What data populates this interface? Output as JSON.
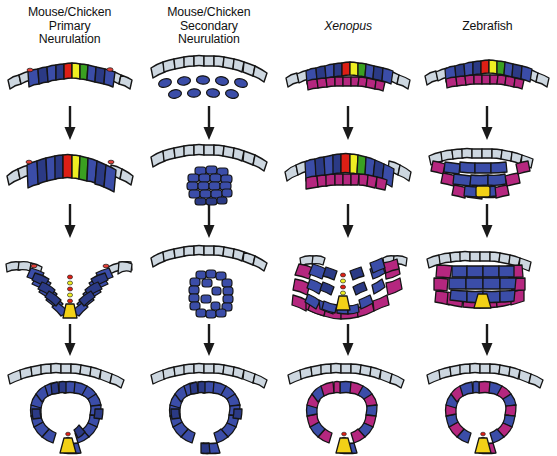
{
  "figure": {
    "background_color": "#ffffff",
    "arrow_color": "#1a1a1a"
  },
  "palette": {
    "epidermis": "#cdd7e0",
    "epidermis_dark": "#6e7b86",
    "neural_blue": "#3b4da8",
    "neural_blue_dark": "#2b3a85",
    "neural_blue_light": "#5566c0",
    "mesoderm_magenta": "#b5277f",
    "mesoderm_magenta_dark": "#96205f",
    "floorplate_yellow": "#f2d117",
    "marker_red": "#dd1f15",
    "marker_yellow": "#eeee22",
    "marker_green": "#3aa021",
    "neural_crest_red": "#e04038",
    "outline": "#151515"
  },
  "columns": [
    {
      "id": "mouse-chicken-primary",
      "header_lines": [
        "Mouse/Chicken",
        "Primary",
        "Neurulation"
      ],
      "italic": false,
      "stages": [
        {
          "name": "neural-plate",
          "description": "Flat neural plate with blue neuroepithelial cells and red, yellow, green midline marker cells flanked by epidermis",
          "has_magenta_layer": false
        },
        {
          "name": "neural-plate-shaping",
          "description": "Thickened neural plate, columnar cells, median hinge point forming",
          "has_magenta_layer": false
        },
        {
          "name": "neural-groove",
          "description": "V-shaped neural groove with elevated neural folds, yellow floor plate and red neural crest at fold tips",
          "has_magenta_layer": false
        },
        {
          "name": "neural-tube",
          "description": "Closed neural tube beneath continuous epidermis, yellow floor plate at ventral midline",
          "has_magenta_layer": false
        }
      ]
    },
    {
      "id": "mouse-chicken-secondary",
      "header_lines": [
        "Mouse/Chicken",
        "Secondary",
        "Neurulation"
      ],
      "italic": false,
      "stages": [
        {
          "name": "mesenchymal-cells",
          "description": "Loose scattered mesenchymal precursor cells beneath the epidermis",
          "has_magenta_layer": false
        },
        {
          "name": "medullary-cord",
          "description": "Mesenchyme condenses into a solid medullary cord below the epidermis",
          "has_magenta_layer": false
        },
        {
          "name": "cavitation",
          "description": "Multiple small lumens cavitate and coalesce within the solid cord",
          "has_magenta_layer": false
        },
        {
          "name": "neural-tube",
          "description": "Single central lumen forms the secondary neural tube",
          "has_magenta_layer": false
        }
      ]
    },
    {
      "id": "xenopus",
      "header_lines": [
        "Xenopus"
      ],
      "italic": true,
      "stages": [
        {
          "name": "neural-plate-bilayer",
          "description": "Bilayered neural plate: superficial blue layer with midline markers over deep magenta layer",
          "has_magenta_layer": true
        },
        {
          "name": "neural-plate-thickening",
          "description": "Neural plate thickens, deep magenta layer expands beneath",
          "has_magenta_layer": true
        },
        {
          "name": "neural-groove",
          "description": "V-shaped groove with inner blue layer and outer magenta layer, yellow floor plate",
          "has_magenta_layer": true
        },
        {
          "name": "neural-tube",
          "description": "Closed neural tube of alternating blue and magenta cells with yellow floor plate",
          "has_magenta_layer": true
        }
      ]
    },
    {
      "id": "zebrafish",
      "header_lines": [
        "Zebrafish"
      ],
      "italic": false,
      "stages": [
        {
          "name": "neural-plate",
          "description": "Neural plate with blue cells, midline red/yellow/green markers and deep magenta layer",
          "has_magenta_layer": true
        },
        {
          "name": "neural-keel",
          "description": "Solid neural keel: cells converge to the midline with no lumen, yellow floor plate cell",
          "has_magenta_layer": true
        },
        {
          "name": "neural-rod",
          "description": "Neural rod, a solid rounded mass of blue cells surrounded by magenta, yellow floor plate",
          "has_magenta_layer": true
        },
        {
          "name": "neural-tube",
          "description": "Lumen forms by cavitation producing the neural tube with yellow floor plate",
          "has_magenta_layer": true
        }
      ]
    }
  ],
  "arrows": {
    "symbol": "downward-arrow",
    "count_per_column": 3
  }
}
